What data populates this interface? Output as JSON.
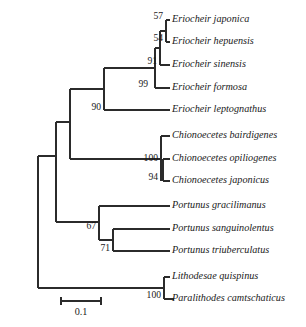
{
  "figure": {
    "width": 306,
    "height": 327,
    "background_color": "#ffffff",
    "line_color": "#2b2b2b"
  },
  "chart_data": {
    "type": "tree",
    "title": "",
    "xlabel": "",
    "ylabel": "",
    "layout": "rectangular-cladogram",
    "orientation": "left-to-right",
    "grid": false,
    "legend": "none",
    "scale_bar": {
      "label": "0.1",
      "units": "substitutions per site",
      "length_px": 40,
      "x_start": 61,
      "x_end": 101,
      "y": 301
    },
    "taxa": [
      {
        "id": "t1",
        "name": "Eriocheir japonica",
        "tip_x": 170,
        "tip_y": 20
      },
      {
        "id": "t2",
        "name": "Eriocheir hepuensis",
        "tip_x": 170,
        "tip_y": 42
      },
      {
        "id": "t3",
        "name": "Eriocheir sinensis",
        "tip_x": 170,
        "tip_y": 65
      },
      {
        "id": "t4",
        "name": "Eriocheir formosa",
        "tip_x": 170,
        "tip_y": 88
      },
      {
        "id": "t5",
        "name": "Eriocheir leptognathus",
        "tip_x": 170,
        "tip_y": 110
      },
      {
        "id": "t6",
        "name": "Chionoecetes bairdigenes",
        "tip_x": 170,
        "tip_y": 136
      },
      {
        "id": "t7",
        "name": "Chionoecetes opiliogenes",
        "tip_x": 170,
        "tip_y": 159
      },
      {
        "id": "t8",
        "name": "Chionoecetes japonicus",
        "tip_x": 170,
        "tip_y": 181
      },
      {
        "id": "t9",
        "name": "Portunus gracilimanus",
        "tip_x": 170,
        "tip_y": 206
      },
      {
        "id": "t10",
        "name": "Portunus sanguinolentus",
        "tip_x": 170,
        "tip_y": 229
      },
      {
        "id": "t11",
        "name": "Portunus triuberculatus",
        "tip_x": 170,
        "tip_y": 251
      },
      {
        "id": "t12",
        "name": "Lithodesae quispinus",
        "tip_x": 170,
        "tip_y": 277
      },
      {
        "id": "t13",
        "name": "Paralithodes camtschaticus",
        "tip_x": 170,
        "tip_y": 299
      }
    ],
    "support_values": [
      {
        "id": "n57",
        "value": "57",
        "x": 163,
        "y": 17,
        "node_x": 166,
        "y_top": 20,
        "y_bottom": 31
      },
      {
        "id": "n54",
        "value": "54",
        "x": 163,
        "y": 39,
        "node_x": 166,
        "y_top": 31,
        "y_bottom": 42
      },
      {
        "id": "n91",
        "value": "91",
        "x": 157,
        "y": 62,
        "node_x": 160,
        "y_top": 31,
        "y_bottom": 65
      },
      {
        "id": "n99",
        "value": "99",
        "x": 148,
        "y": 85,
        "node_x": 155,
        "y_top": 48,
        "y_bottom": 88
      },
      {
        "id": "n90",
        "value": "90",
        "x": 101,
        "y": 108,
        "node_x": 104,
        "y_top": 68,
        "y_bottom": 110
      },
      {
        "id": "n100a",
        "value": "100",
        "x": 158,
        "y": 159,
        "node_x": 161,
        "y_top": 136,
        "y_bottom": 181
      },
      {
        "id": "n94",
        "value": "94",
        "x": 158,
        "y": 178,
        "node_x": 163,
        "y_top": 159,
        "y_bottom": 181
      },
      {
        "id": "n67",
        "value": "67",
        "x": 96,
        "y": 227,
        "node_x": 99,
        "y_top": 206,
        "y_bottom": 240
      },
      {
        "id": "n71",
        "value": "71",
        "x": 110,
        "y": 249,
        "node_x": 113,
        "y_top": 229,
        "y_bottom": 251
      },
      {
        "id": "n100b",
        "value": "100",
        "x": 161,
        "y": 296,
        "node_x": 164,
        "y_top": 277,
        "y_bottom": 299
      }
    ],
    "branches": [
      {
        "from": "root-spine",
        "x1": 38,
        "y1": 156,
        "x2": 38,
        "y2": 288
      },
      {
        "from": "root-to-crown",
        "x1": 38,
        "y1": 156,
        "x2": 56,
        "y2": 156
      },
      {
        "from": "root-to-outgroup",
        "x1": 38,
        "y1": 288,
        "x2": 164,
        "y2": 288
      },
      {
        "from": "crown-spine",
        "x1": 56,
        "y1": 156,
        "x2": 56,
        "y2": 222
      },
      {
        "from": "crown-upper-h",
        "x1": 56,
        "y1": 122,
        "x2": 70,
        "y2": 122
      },
      {
        "from": "crown-upper-spine",
        "x1": 56,
        "y1": 122,
        "x2": 56,
        "y2": 156
      },
      {
        "from": "brachy-spine",
        "x1": 70,
        "y1": 89,
        "x2": 70,
        "y2": 159
      },
      {
        "from": "eriocheir-h",
        "x1": 70,
        "y1": 89,
        "x2": 104,
        "y2": 89
      },
      {
        "from": "n90-spine",
        "x1": 104,
        "y1": 68,
        "x2": 104,
        "y2": 110
      },
      {
        "from": "n90-upper-h",
        "x1": 104,
        "y1": 68,
        "x2": 155,
        "y2": 68
      },
      {
        "from": "n90-lower-h",
        "x1": 104,
        "y1": 110,
        "x2": 170,
        "y2": 110
      },
      {
        "from": "n99-spine",
        "x1": 155,
        "y1": 48,
        "x2": 155,
        "y2": 88
      },
      {
        "from": "n99-upper-h",
        "x1": 155,
        "y1": 48,
        "x2": 160,
        "y2": 48
      },
      {
        "from": "n99-lower-h",
        "x1": 155,
        "y1": 88,
        "x2": 170,
        "y2": 88
      },
      {
        "from": "n91-spine",
        "x1": 160,
        "y1": 31,
        "x2": 160,
        "y2": 65
      },
      {
        "from": "n91-upper-h",
        "x1": 160,
        "y1": 31,
        "x2": 166,
        "y2": 31
      },
      {
        "from": "n91-lower-h",
        "x1": 160,
        "y1": 65,
        "x2": 170,
        "y2": 65
      },
      {
        "from": "n57-spine",
        "x1": 166,
        "y1": 20,
        "x2": 166,
        "y2": 42
      },
      {
        "from": "n57-upper-h",
        "x1": 166,
        "y1": 20,
        "x2": 170,
        "y2": 20
      },
      {
        "from": "n54-lower-h",
        "x1": 166,
        "y1": 42,
        "x2": 170,
        "y2": 42
      },
      {
        "from": "chiono-h",
        "x1": 70,
        "y1": 159,
        "x2": 161,
        "y2": 159
      },
      {
        "from": "n100a-spine",
        "x1": 161,
        "y1": 136,
        "x2": 161,
        "y2": 181
      },
      {
        "from": "n100a-upper-h",
        "x1": 161,
        "y1": 136,
        "x2": 170,
        "y2": 136
      },
      {
        "from": "n94-spine",
        "x1": 163,
        "y1": 159,
        "x2": 163,
        "y2": 181
      },
      {
        "from": "n94-upper-h",
        "x1": 163,
        "y1": 159,
        "x2": 170,
        "y2": 159
      },
      {
        "from": "n94-lower-h",
        "x1": 163,
        "y1": 181,
        "x2": 170,
        "y2": 181
      },
      {
        "from": "portunus-h",
        "x1": 56,
        "y1": 222,
        "x2": 99,
        "y2": 222
      },
      {
        "from": "n67-spine",
        "x1": 99,
        "y1": 206,
        "x2": 99,
        "y2": 240
      },
      {
        "from": "n67-upper-h",
        "x1": 99,
        "y1": 206,
        "x2": 170,
        "y2": 206
      },
      {
        "from": "n67-lower-h",
        "x1": 99,
        "y1": 240,
        "x2": 113,
        "y2": 240
      },
      {
        "from": "n71-spine",
        "x1": 113,
        "y1": 229,
        "x2": 113,
        "y2": 251
      },
      {
        "from": "n71-upper-h",
        "x1": 113,
        "y1": 229,
        "x2": 170,
        "y2": 229
      },
      {
        "from": "n71-lower-h",
        "x1": 113,
        "y1": 251,
        "x2": 170,
        "y2": 251
      },
      {
        "from": "n100b-spine",
        "x1": 164,
        "y1": 277,
        "x2": 164,
        "y2": 299
      },
      {
        "from": "n100b-upper-h",
        "x1": 164,
        "y1": 277,
        "x2": 170,
        "y2": 277
      },
      {
        "from": "n100b-lower-h",
        "x1": 164,
        "y1": 299,
        "x2": 174,
        "y2": 299
      }
    ]
  }
}
